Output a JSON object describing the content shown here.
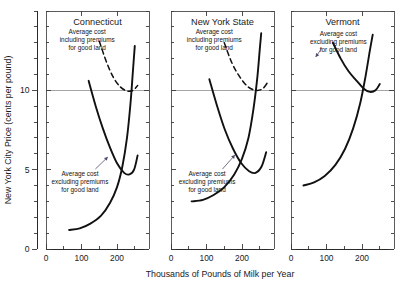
{
  "figure": {
    "background": "#ffffff",
    "ink_color": "#111111",
    "grid_color": "#8f8f8f"
  },
  "axes": {
    "ylabel": "New York City Price (cents per pound)",
    "xlabel": "Thousands of Pounds of Milk per Year",
    "y_tick_labels": [
      "0",
      "5",
      "10"
    ],
    "y_tick_values": [
      0,
      5,
      10
    ],
    "x_tick_labels": [
      "0",
      "100",
      "200"
    ],
    "x_tick_values": [
      0,
      100,
      200
    ],
    "ylim": [
      0,
      15
    ],
    "xlim": [
      0,
      290
    ],
    "y_minor_step": 1,
    "x_minor_step": 50,
    "gridline_at": 10
  },
  "panels": [
    {
      "id": "connecticut",
      "title": "Connecticut",
      "annotations": [
        {
          "id": "including",
          "lines": [
            "Average cost",
            "including premiums",
            "for good land"
          ]
        },
        {
          "id": "excluding",
          "lines": [
            "Average cost",
            "excluding premiums",
            "for good land"
          ]
        }
      ],
      "curves": [
        {
          "id": "average-cost-including-premiums",
          "style": "dashed",
          "label": "Average cost including premiums for good land",
          "points": [
            [
              150,
              13.1
            ],
            [
              170,
              11.8
            ],
            [
              190,
              10.8
            ],
            [
              210,
              10.2
            ],
            [
              230,
              9.95
            ],
            [
              245,
              10.0
            ],
            [
              258,
              10.3
            ]
          ]
        },
        {
          "id": "average-cost-excluding-premiums",
          "style": "solid",
          "label": "Average cost excluding premiums for good land",
          "points": [
            [
              120,
              10.6
            ],
            [
              140,
              9.0
            ],
            [
              160,
              7.6
            ],
            [
              180,
              6.4
            ],
            [
              200,
              5.4
            ],
            [
              220,
              4.8
            ],
            [
              235,
              4.7
            ],
            [
              248,
              5.0
            ],
            [
              258,
              5.9
            ]
          ]
        },
        {
          "id": "marginal-cost",
          "style": "solid",
          "label": "Marginal cost",
          "points": [
            [
              65,
              1.2
            ],
            [
              95,
              1.3
            ],
            [
              125,
              1.6
            ],
            [
              155,
              2.1
            ],
            [
              180,
              2.9
            ],
            [
              200,
              3.9
            ],
            [
              215,
              5.2
            ],
            [
              228,
              7.0
            ],
            [
              238,
              9.2
            ],
            [
              245,
              11.3
            ],
            [
              250,
              12.8
            ]
          ]
        }
      ]
    },
    {
      "id": "new-york-state",
      "title": "New York State",
      "annotations": [
        {
          "id": "including",
          "lines": [
            "Average cost",
            "including premiums",
            "for good land"
          ]
        },
        {
          "id": "excluding",
          "lines": [
            "Average cost",
            "excluding premiums",
            "for good land"
          ]
        }
      ],
      "curves": [
        {
          "id": "average-cost-including-premiums",
          "style": "dashed",
          "label": "Average cost including premiums for good land",
          "points": [
            [
              150,
              13.0
            ],
            [
              172,
              11.7
            ],
            [
              195,
              10.8
            ],
            [
              218,
              10.2
            ],
            [
              240,
              10.0
            ],
            [
              258,
              10.1
            ],
            [
              272,
              10.5
            ]
          ]
        },
        {
          "id": "average-cost-excluding-premiums",
          "style": "solid",
          "label": "Average cost excluding premiums for good land",
          "points": [
            [
              108,
              10.7
            ],
            [
              130,
              9.0
            ],
            [
              152,
              7.5
            ],
            [
              175,
              6.3
            ],
            [
              198,
              5.4
            ],
            [
              220,
              4.9
            ],
            [
              238,
              4.8
            ],
            [
              255,
              5.2
            ],
            [
              268,
              6.1
            ]
          ]
        },
        {
          "id": "marginal-cost",
          "style": "solid",
          "label": "Marginal cost",
          "points": [
            [
              58,
              3.0
            ],
            [
              90,
              3.1
            ],
            [
              120,
              3.4
            ],
            [
              150,
              3.9
            ],
            [
              178,
              4.7
            ],
            [
              200,
              5.7
            ],
            [
              218,
              7.0
            ],
            [
              232,
              8.8
            ],
            [
              243,
              10.8
            ],
            [
              250,
              12.6
            ],
            [
              254,
              13.6
            ]
          ]
        }
      ]
    },
    {
      "id": "vermont",
      "title": "Vermont",
      "annotations": [
        {
          "id": "excluding",
          "lines": [
            "Average cost",
            "excluding premiums",
            "for good land"
          ]
        }
      ],
      "curves": [
        {
          "id": "average-cost-excluding-premiums",
          "style": "solid",
          "label": "Average cost excluding premiums for good land",
          "points": [
            [
              118,
              13.0
            ],
            [
              140,
              12.0
            ],
            [
              162,
              11.2
            ],
            [
              185,
              10.6
            ],
            [
              205,
              10.1
            ],
            [
              222,
              9.9
            ],
            [
              238,
              10.0
            ],
            [
              250,
              10.4
            ]
          ]
        },
        {
          "id": "marginal-cost",
          "style": "solid",
          "label": "Marginal cost",
          "points": [
            [
              35,
              4.0
            ],
            [
              65,
              4.2
            ],
            [
              95,
              4.6
            ],
            [
              125,
              5.3
            ],
            [
              152,
              6.3
            ],
            [
              175,
              7.6
            ],
            [
              195,
              9.2
            ],
            [
              210,
              10.9
            ],
            [
              222,
              12.5
            ],
            [
              230,
              13.5
            ]
          ]
        }
      ]
    }
  ]
}
